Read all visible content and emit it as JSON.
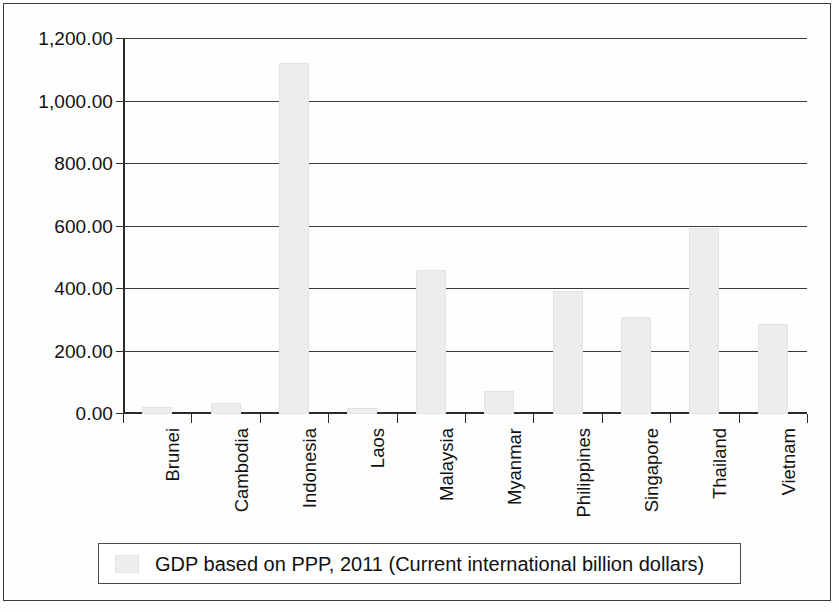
{
  "chart_data": {
    "type": "bar",
    "title": "",
    "subtitle": "",
    "xlabel": "",
    "ylabel": "",
    "categories": [
      "Brunei",
      "Cambodia",
      "Indonesia",
      "Laos",
      "Malaysia",
      "Myanmar",
      "Philippines",
      "Singapore",
      "Thailand",
      "Vietnam"
    ],
    "values": [
      21.0,
      36.0,
      1124.0,
      18.0,
      462.0,
      75.0,
      393.0,
      309.0,
      596.0,
      287.0
    ],
    "series": [
      {
        "name": "GDP based on PPP, 2011 (Current international billion dollars)",
        "values": [
          21.0,
          36.0,
          1124.0,
          18.0,
          462.0,
          75.0,
          393.0,
          309.0,
          596.0,
          287.0
        ]
      }
    ],
    "ylim": [
      0,
      1200
    ],
    "ytick_values": [
      0,
      200,
      400,
      600,
      800,
      1000,
      1200
    ],
    "ytick_labels": [
      "0.00",
      "200.00",
      "400.00",
      "600.00",
      "800.00",
      "1,000.00",
      "1,200.00"
    ],
    "grid": true,
    "legend_position": "bottom",
    "bar_color": "#ededed",
    "axis_color": "#2b2b2b",
    "grid_color": "#39393c"
  },
  "legend": {
    "label": "GDP based on PPP, 2011 (Current international billion dollars)",
    "swatch_color": "#eeeeee"
  }
}
